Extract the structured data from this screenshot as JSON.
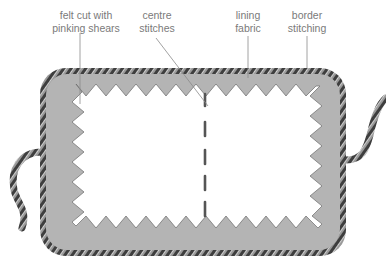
{
  "figure": {
    "type": "illustration",
    "labels": [
      {
        "id": "felt",
        "line1": "felt cut with",
        "line2": "pinking shears"
      },
      {
        "id": "centre",
        "line1": "centre",
        "line2": "stitches"
      },
      {
        "id": "lining",
        "line1": "lining",
        "line2": "fabric"
      },
      {
        "id": "border",
        "line1": "border",
        "line2": "stitching"
      }
    ],
    "colors": {
      "felt": "#b4b4b4",
      "felt_shade": "#9c9c9c",
      "rope_dark": "#3e3e3e",
      "rope_light": "#9a9a9a",
      "lining": "#ffffff",
      "label_text": "#7a7a7a",
      "leader_line": "#8a8a8a"
    }
  }
}
